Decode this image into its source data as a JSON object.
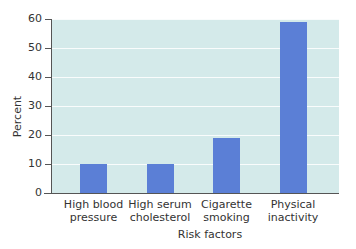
{
  "chart_data": {
    "type": "bar",
    "title": "",
    "xlabel": "Risk factors",
    "ylabel": "Percent",
    "categories": [
      "High blood pressure",
      "High serum cholesterol",
      "Cigarette smoking",
      "Physical inactivity"
    ],
    "category_lines": [
      [
        "High blood",
        "pressure"
      ],
      [
        "High serum",
        "cholesterol"
      ],
      [
        "Cigarette",
        "smoking"
      ],
      [
        "Physical",
        "inactivity"
      ]
    ],
    "values": [
      10,
      10,
      19,
      59
    ],
    "ylim": [
      0,
      60
    ],
    "yticks": [
      0,
      10,
      20,
      30,
      40,
      50,
      60
    ],
    "grid": true,
    "legend": null,
    "colors": {
      "bar": "#5b7fd6",
      "plot_background": "#d4eaea",
      "gridline": "#ffffff"
    }
  }
}
